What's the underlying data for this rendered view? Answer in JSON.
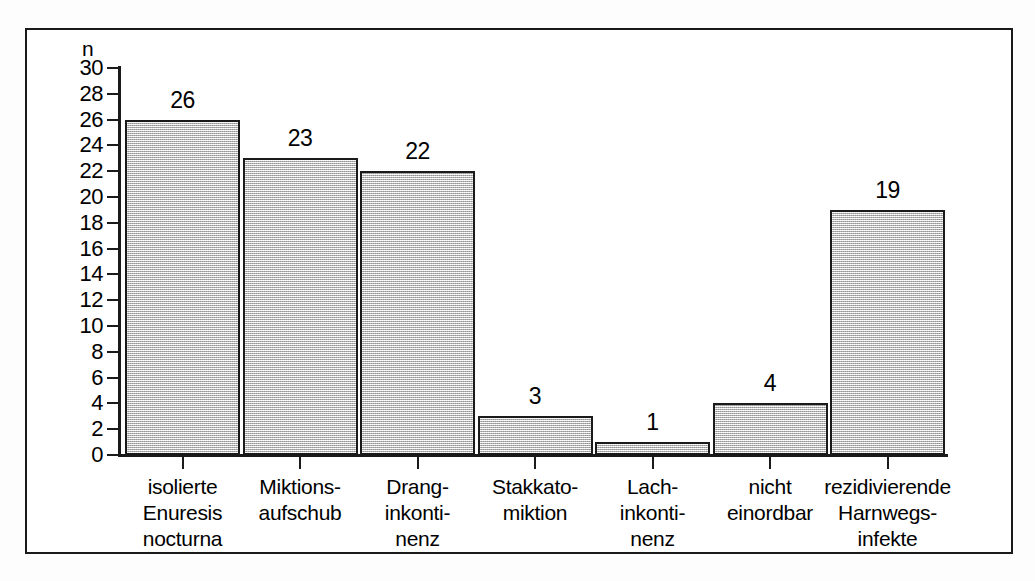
{
  "figure": {
    "y_axis_title": "n",
    "frame": {
      "border_color": "#1a1a1a"
    },
    "bar_fill_color": "#d4d4d4",
    "bar_border_color": "#1a1a1a"
  },
  "chart_data": {
    "type": "bar",
    "title": "",
    "xlabel": "",
    "ylabel": "n",
    "ylim": [
      0,
      30
    ],
    "ytick_step": 2,
    "grid": false,
    "legend": "none",
    "categories": [
      "isolierte Enuresis nocturna",
      "Miktionsaufschub",
      "Dranginkontinenz",
      "Stakkatomiktion",
      "Lachinkontinenz",
      "nicht einordbar",
      "rezidivierende Harnwegsinfekte"
    ],
    "category_lines": [
      [
        "isolierte",
        "Enuresis",
        "nocturna"
      ],
      [
        "Miktions-",
        "aufschub"
      ],
      [
        "Drang-",
        "inkonti-",
        "nenz"
      ],
      [
        "Stakkato-",
        "miktion"
      ],
      [
        "Lach-",
        "inkonti-",
        "nenz"
      ],
      [
        "nicht",
        "einordbar"
      ],
      [
        "rezidivierende",
        "Harnwegs-",
        "infekte"
      ]
    ],
    "values": [
      26,
      23,
      22,
      3,
      1,
      4,
      19
    ],
    "value_labels": [
      "26",
      "23",
      "22",
      "3",
      "1",
      "4",
      "19"
    ],
    "yticks": [
      0,
      2,
      4,
      6,
      8,
      10,
      12,
      14,
      16,
      18,
      20,
      22,
      24,
      26,
      28,
      30
    ],
    "ytick_labels": [
      "0",
      "2",
      "4",
      "6",
      "8",
      "10",
      "12",
      "14",
      "16",
      "18",
      "20",
      "22",
      "24",
      "26",
      "28",
      "30"
    ]
  }
}
